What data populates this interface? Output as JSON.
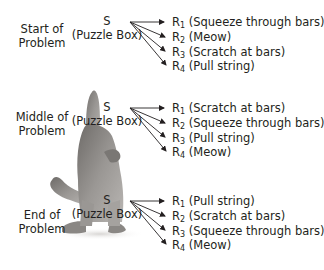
{
  "diagram": {
    "stimulus": {
      "symbol": "S",
      "description": "(Puzzle Box)"
    },
    "stages": [
      {
        "label_line1": "Start of",
        "label_line2": "Problem",
        "responses": [
          {
            "symbol": "R",
            "index": "1",
            "text": "(Squeeze through bars)"
          },
          {
            "symbol": "R",
            "index": "2",
            "text": "(Meow)"
          },
          {
            "symbol": "R",
            "index": "3",
            "text": "(Scratch at bars)"
          },
          {
            "symbol": "R",
            "index": "4",
            "text": "(Pull string)"
          }
        ]
      },
      {
        "label_line1": "Middle of",
        "label_line2": "Problem",
        "responses": [
          {
            "symbol": "R",
            "index": "1",
            "text": "(Scratch at bars)"
          },
          {
            "symbol": "R",
            "index": "2",
            "text": "(Squeeze through bars)"
          },
          {
            "symbol": "R",
            "index": "3",
            "text": "(Pull string)"
          },
          {
            "symbol": "R",
            "index": "4",
            "text": "(Meow)"
          }
        ]
      },
      {
        "label_line1": "End of",
        "label_line2": "Problem",
        "responses": [
          {
            "symbol": "R",
            "index": "1",
            "text": "(Pull string)"
          },
          {
            "symbol": "R",
            "index": "2",
            "text": "(Scratch at bars)"
          },
          {
            "symbol": "R",
            "index": "3",
            "text": "(Squeeze through bars)"
          },
          {
            "symbol": "R",
            "index": "4",
            "text": "(Meow)"
          }
        ]
      }
    ],
    "image": {
      "subject": "standing-cat-photo"
    },
    "colors": {
      "text": "#231f20",
      "arrows": "#231f20",
      "cat_fur": "#8a8784",
      "background": "#ffffff"
    }
  }
}
